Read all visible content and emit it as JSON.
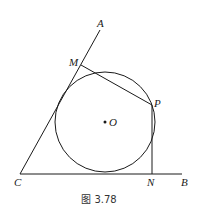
{
  "figure": {
    "caption": "图 3.78",
    "stroke_color": "#1a1a1a",
    "background": "#ffffff"
  },
  "points": {
    "A": {
      "label": "A",
      "x": 100,
      "y": 30
    },
    "M": {
      "label": "M",
      "x": 81,
      "y": 65
    },
    "P": {
      "label": "P",
      "x": 152,
      "y": 105
    },
    "O": {
      "label": "O",
      "x": 105,
      "y": 122
    },
    "C": {
      "label": "C",
      "x": 20,
      "y": 174
    },
    "N": {
      "label": "N",
      "x": 152,
      "y": 174
    },
    "B": {
      "label": "B",
      "x": 182,
      "y": 174
    }
  },
  "circle": {
    "center": "O",
    "r": 50
  }
}
